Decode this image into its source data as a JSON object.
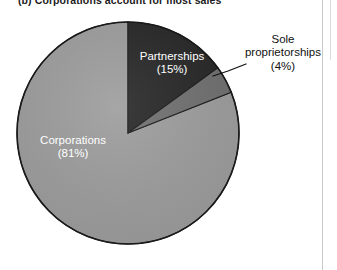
{
  "figure": {
    "caption": "(b) Corporations account for most sales",
    "background_color": "#ffffff"
  },
  "gutter": {
    "rule_color": "#c9c9c9"
  },
  "chart_data": {
    "type": "pie",
    "title": "(b) Corporations account for most sales",
    "xlabel": "",
    "ylabel": "",
    "legend_position": "none",
    "grid": false,
    "start_angle_deg": 0,
    "direction": "clockwise",
    "categories": [
      "Partnerships",
      "Sole proprietorships",
      "Corporations"
    ],
    "values": [
      15,
      4,
      81
    ],
    "units": "percent",
    "colors": [
      "#262626",
      "#6f6f6f",
      "#9c9c9c"
    ],
    "slices": [
      {
        "name": "Partnerships",
        "label": "Partnerships",
        "value": 15,
        "value_label": "(15%)",
        "color": "#262626",
        "label_color": "#ffffff",
        "label_placement": "inside"
      },
      {
        "name": "Sole proprietorships",
        "label": "Sole\nproprietorships",
        "label_line1": "Sole",
        "label_line2": "proprietorships",
        "value": 4,
        "value_label": "(4%)",
        "color": "#6f6f6f",
        "label_color": "#111111",
        "label_placement": "outside-with-leader"
      },
      {
        "name": "Corporations",
        "label": "Corporations",
        "value": 81,
        "value_label": "(81%)",
        "color": "#9c9c9c",
        "label_color": "#ffffff",
        "label_placement": "inside"
      }
    ],
    "annotations": [
      {
        "name": "sole-proprietorships-leader-line",
        "from": [
          215,
          78
        ],
        "to": [
          246,
          64
        ]
      }
    ]
  },
  "geometry": {
    "center_x": 128,
    "center_y": 133,
    "radius": 111,
    "outline_color": "#1a1a1a"
  }
}
